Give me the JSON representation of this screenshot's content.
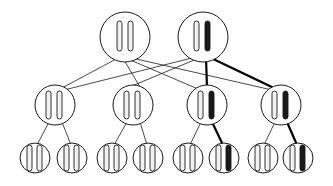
{
  "figure": {
    "title": "",
    "background": "#ffffff",
    "width": 333,
    "height": 186,
    "stroke_color": "#1a1a1a",
    "bold_stroke_color": "#000000",
    "thin_edge_width": 0.8,
    "bold_edge_width": 2.2,
    "node_outline_width": 1.0,
    "glyph_outline_width": 0.9,
    "glyph_fill_light": "#f2f2f2",
    "glyph_fill_dark": "#1a1a1a"
  },
  "chart_data": {
    "type": "diagram",
    "diagram_kind": "three-level-node-link-tree",
    "levels": [
      {
        "name": "root-level",
        "index": 0,
        "node_count": 2,
        "y": 37,
        "radius": 25
      },
      {
        "name": "middle-level",
        "index": 1,
        "node_count": 4,
        "y": 105,
        "radius": 20
      },
      {
        "name": "leaf-level",
        "index": 2,
        "node_count": 8,
        "y": 158,
        "radius": 15
      }
    ],
    "nodes": [
      {
        "id": "r0",
        "level": 0,
        "cx": 125,
        "cy": 37,
        "r": 25,
        "glyphs": [
          {
            "name": "bar-left",
            "dx": -8,
            "w": 5,
            "h": 30,
            "top_off": -16,
            "shade": "light"
          },
          {
            "name": "bar-right",
            "dx": 3,
            "w": 5,
            "h": 30,
            "top_off": -16,
            "shade": "light"
          }
        ]
      },
      {
        "id": "r1",
        "level": 0,
        "cx": 203,
        "cy": 37,
        "r": 25,
        "glyphs": [
          {
            "name": "bar-left",
            "dx": -9,
            "w": 5,
            "h": 30,
            "top_off": -16,
            "shade": "light"
          },
          {
            "name": "bar-right",
            "dx": 2,
            "w": 5,
            "h": 30,
            "top_off": -16,
            "shade": "dark"
          }
        ]
      },
      {
        "id": "m0",
        "level": 1,
        "cx": 55,
        "cy": 105,
        "r": 20,
        "glyphs": [
          {
            "name": "bar-left",
            "dx": -9,
            "w": 5,
            "h": 28,
            "top_off": -14,
            "shade": "light"
          },
          {
            "name": "bar-right",
            "dx": 2,
            "w": 5,
            "h": 28,
            "top_off": -14,
            "shade": "light"
          }
        ]
      },
      {
        "id": "m1",
        "level": 1,
        "cx": 133,
        "cy": 105,
        "r": 20,
        "glyphs": [
          {
            "name": "bar-left",
            "dx": -9,
            "w": 5,
            "h": 28,
            "top_off": -14,
            "shade": "light"
          },
          {
            "name": "bar-right",
            "dx": 2,
            "w": 5,
            "h": 28,
            "top_off": -14,
            "shade": "light"
          }
        ]
      },
      {
        "id": "m2",
        "level": 1,
        "cx": 207,
        "cy": 105,
        "r": 20,
        "glyphs": [
          {
            "name": "bar-left",
            "dx": -9,
            "w": 5,
            "h": 28,
            "top_off": -14,
            "shade": "light"
          },
          {
            "name": "bar-right",
            "dx": 2,
            "w": 5,
            "h": 28,
            "top_off": -14,
            "shade": "dark"
          }
        ]
      },
      {
        "id": "m3",
        "level": 1,
        "cx": 281,
        "cy": 105,
        "r": 20,
        "glyphs": [
          {
            "name": "bar-left",
            "dx": -9,
            "w": 5,
            "h": 28,
            "top_off": -14,
            "shade": "light"
          },
          {
            "name": "bar-right",
            "dx": 2,
            "w": 5,
            "h": 28,
            "top_off": -14,
            "shade": "dark"
          }
        ]
      },
      {
        "id": "l0",
        "level": 2,
        "cx": 35,
        "cy": 158,
        "r": 15,
        "glyphs": [
          {
            "name": "bar-left",
            "dx": -8,
            "w": 5,
            "h": 26,
            "top_off": -13,
            "shade": "light"
          },
          {
            "name": "bar-right",
            "dx": 2,
            "w": 5,
            "h": 26,
            "top_off": -13,
            "shade": "light"
          }
        ]
      },
      {
        "id": "l1",
        "level": 2,
        "cx": 72,
        "cy": 158,
        "r": 15,
        "glyphs": [
          {
            "name": "bar-left",
            "dx": -8,
            "w": 5,
            "h": 26,
            "top_off": -13,
            "shade": "light"
          },
          {
            "name": "bar-right",
            "dx": 2,
            "w": 5,
            "h": 26,
            "top_off": -13,
            "shade": "light"
          }
        ]
      },
      {
        "id": "l2",
        "level": 2,
        "cx": 112,
        "cy": 158,
        "r": 15,
        "glyphs": [
          {
            "name": "bar-left",
            "dx": -8,
            "w": 5,
            "h": 26,
            "top_off": -13,
            "shade": "light"
          },
          {
            "name": "bar-right",
            "dx": 2,
            "w": 5,
            "h": 26,
            "top_off": -13,
            "shade": "light"
          }
        ]
      },
      {
        "id": "l3",
        "level": 2,
        "cx": 148,
        "cy": 158,
        "r": 15,
        "glyphs": [
          {
            "name": "bar-left",
            "dx": -8,
            "w": 5,
            "h": 26,
            "top_off": -13,
            "shade": "light"
          },
          {
            "name": "bar-right",
            "dx": 2,
            "w": 5,
            "h": 26,
            "top_off": -13,
            "shade": "light"
          }
        ]
      },
      {
        "id": "l4",
        "level": 2,
        "cx": 188,
        "cy": 158,
        "r": 15,
        "glyphs": [
          {
            "name": "bar-left",
            "dx": -8,
            "w": 5,
            "h": 26,
            "top_off": -13,
            "shade": "light"
          },
          {
            "name": "bar-right",
            "dx": 2,
            "w": 5,
            "h": 26,
            "top_off": -13,
            "shade": "light"
          }
        ]
      },
      {
        "id": "l5",
        "level": 2,
        "cx": 224,
        "cy": 158,
        "r": 15,
        "glyphs": [
          {
            "name": "bar-left",
            "dx": -8,
            "w": 5,
            "h": 26,
            "top_off": -13,
            "shade": "light"
          },
          {
            "name": "bar-right",
            "dx": 2,
            "w": 5,
            "h": 26,
            "top_off": -13,
            "shade": "dark"
          }
        ]
      },
      {
        "id": "l6",
        "level": 2,
        "cx": 263,
        "cy": 158,
        "r": 15,
        "glyphs": [
          {
            "name": "bar-left",
            "dx": -8,
            "w": 5,
            "h": 26,
            "top_off": -13,
            "shade": "light"
          },
          {
            "name": "bar-right",
            "dx": 2,
            "w": 5,
            "h": 26,
            "top_off": -13,
            "shade": "light"
          }
        ]
      },
      {
        "id": "l7",
        "level": 2,
        "cx": 298,
        "cy": 158,
        "r": 15,
        "glyphs": [
          {
            "name": "bar-left",
            "dx": -8,
            "w": 5,
            "h": 26,
            "top_off": -13,
            "shade": "light"
          },
          {
            "name": "bar-right",
            "dx": 2,
            "w": 5,
            "h": 26,
            "top_off": -13,
            "shade": "dark"
          }
        ]
      }
    ],
    "edges": [
      {
        "name": "edge-r0-m0",
        "x1": 118,
        "y1": 58,
        "x2": 62,
        "y2": 88,
        "bold": false
      },
      {
        "name": "edge-r0-m2",
        "x1": 128,
        "y1": 59,
        "x2": 198,
        "y2": 89,
        "bold": false
      },
      {
        "name": "edge-r0-m3",
        "x1": 132,
        "y1": 58,
        "x2": 272,
        "y2": 90,
        "bold": false
      },
      {
        "name": "edge-r0-m1",
        "x1": 124,
        "y1": 60,
        "x2": 140,
        "y2": 87,
        "bold": false
      },
      {
        "name": "edge-r1-m0",
        "x1": 196,
        "y1": 57,
        "x2": 64,
        "y2": 90,
        "bold": false
      },
      {
        "name": "edge-r1-m1",
        "x1": 199,
        "y1": 58,
        "x2": 127,
        "y2": 88,
        "bold": false
      },
      {
        "name": "edge-r1-m2",
        "x1": 206,
        "y1": 57,
        "x2": 207,
        "y2": 88,
        "bold": true
      },
      {
        "name": "edge-r1-m3",
        "x1": 209,
        "y1": 57,
        "x2": 276,
        "y2": 89,
        "bold": true
      },
      {
        "name": "edge-m0-l0",
        "x1": 49,
        "y1": 122,
        "x2": 37,
        "y2": 145,
        "bold": false
      },
      {
        "name": "edge-m0-l1",
        "x1": 62,
        "y1": 122,
        "x2": 71,
        "y2": 145,
        "bold": false
      },
      {
        "name": "edge-m1-l2",
        "x1": 127,
        "y1": 122,
        "x2": 114,
        "y2": 145,
        "bold": false
      },
      {
        "name": "edge-m1-l3",
        "x1": 140,
        "y1": 122,
        "x2": 147,
        "y2": 145,
        "bold": false
      },
      {
        "name": "edge-m2-l4",
        "x1": 201,
        "y1": 122,
        "x2": 190,
        "y2": 145,
        "bold": false
      },
      {
        "name": "edge-m2-l5",
        "x1": 212,
        "y1": 122,
        "x2": 223,
        "y2": 145,
        "bold": true
      },
      {
        "name": "edge-m3-l6",
        "x1": 275,
        "y1": 122,
        "x2": 264,
        "y2": 145,
        "bold": false
      },
      {
        "name": "edge-m3-l7",
        "x1": 287,
        "y1": 122,
        "x2": 297,
        "y2": 145,
        "bold": true
      }
    ]
  }
}
